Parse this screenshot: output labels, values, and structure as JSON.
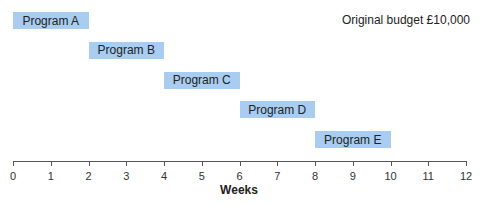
{
  "chart_data": {
    "type": "gantt",
    "title": "",
    "annotation": "Original budget £10,000",
    "xlabel": "Weeks",
    "ylabel": "",
    "xlim": [
      0,
      12
    ],
    "xticks": [
      0,
      1,
      2,
      3,
      4,
      5,
      6,
      7,
      8,
      9,
      10,
      11,
      12
    ],
    "grid": false,
    "tasks": [
      {
        "name": "Program A",
        "start": 0,
        "end": 2
      },
      {
        "name": "Program B",
        "start": 2,
        "end": 4
      },
      {
        "name": "Program C",
        "start": 4,
        "end": 6
      },
      {
        "name": "Program D",
        "start": 6,
        "end": 8
      },
      {
        "name": "Program E",
        "start": 8,
        "end": 10
      }
    ],
    "bar_color": "#a8cdf0"
  }
}
